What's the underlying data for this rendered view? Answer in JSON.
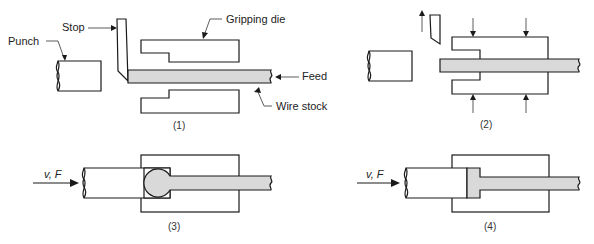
{
  "figure": {
    "panels": [
      {
        "id": "1",
        "caption": "(1)",
        "labels": {
          "punch": "Punch",
          "stop": "Stop",
          "gripping_die": "Gripping die",
          "feed": "Feed",
          "wire_stock": "Wire stock"
        }
      },
      {
        "id": "2",
        "caption": "(2)"
      },
      {
        "id": "3",
        "caption": "(3)",
        "force_label": "v, F"
      },
      {
        "id": "4",
        "caption": "(4)",
        "force_label": "v, F"
      }
    ],
    "colors": {
      "line": "#1a1a1a",
      "wire_fill": "#d9d9d9",
      "background": "#ffffff"
    }
  }
}
